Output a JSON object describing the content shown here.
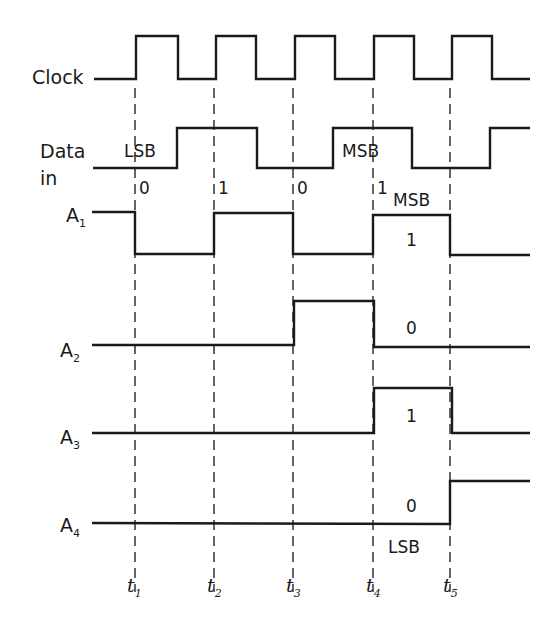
{
  "diagram": {
    "type": "timing-diagram",
    "signals": [
      {
        "name": "Clock",
        "label": "Clock",
        "levels": "clock pulses rising at t1..t5"
      },
      {
        "name": "Data in",
        "label_line1": "Data",
        "label_line2": "in",
        "bits": [
          "0",
          "1",
          "0",
          "1"
        ]
      },
      {
        "name": "A1",
        "label": "A",
        "subscript": "1",
        "final_value": "1",
        "annotation": "MSB"
      },
      {
        "name": "A2",
        "label": "A",
        "subscript": "2",
        "final_value": "0"
      },
      {
        "name": "A3",
        "label": "A",
        "subscript": "3",
        "final_value": "1"
      },
      {
        "name": "A4",
        "label": "A",
        "subscript": "4",
        "final_value": "0",
        "annotation": "LSB"
      }
    ],
    "data_annotations": {
      "lsb": "LSB",
      "msb": "MSB"
    },
    "time_markers": [
      {
        "label": "t",
        "subscript": "1"
      },
      {
        "label": "t",
        "subscript": "2"
      },
      {
        "label": "t",
        "subscript": "3"
      },
      {
        "label": "t",
        "subscript": "4"
      },
      {
        "label": "t",
        "subscript": "5"
      }
    ]
  }
}
